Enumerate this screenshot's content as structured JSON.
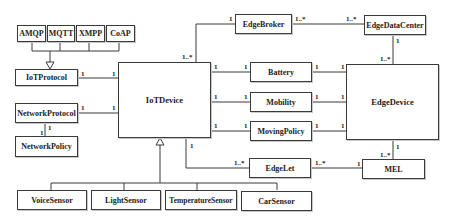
{
  "diagram": {
    "type": "UML class diagram",
    "classes": {
      "amqp": "AMQP",
      "mqtt": "MQTT",
      "xmpp": "XMPP",
      "coap": "CoAP",
      "iot_protocol": "IoTProtocol",
      "network_protocol": "NetworkProtocol",
      "network_policy": "NetworkPolicy",
      "iot_device": "IoTDevice",
      "edge_broker": "EdgeBroker",
      "edge_data_center": "EdgeDataCenter",
      "battery": "Battery",
      "mobility": "Mobility",
      "moving_policy": "MovingPolicy",
      "edge_device": "EdgeDevice",
      "edge_let": "EdgeLet",
      "mel": "MEL",
      "voice_sensor": "VoiceSensor",
      "light_sensor": "LightSensor",
      "temperature_sensor": "TemperatureSensor",
      "car_sensor": "CarSensor"
    },
    "multiplicities": {
      "iotprotocol_side": "1",
      "iotprotocol_device_side": "1",
      "netprotocol_side": "1",
      "netprotocol_device_side": "1",
      "netprotocol_policy_top": "1",
      "netpolicy_top": "1",
      "device_broker": "1..*",
      "broker_device": "1",
      "broker_dc": "1..*",
      "dc_broker": "1..*",
      "dc_edgedevice": "1",
      "edgedevice_dc": "1..*",
      "device_battery": "1",
      "battery_device": "1",
      "battery_edgedevice": "1",
      "edgedevice_battery": "1",
      "device_mobility": "1",
      "mobility_device": "1",
      "mobility_edgedevice": "1",
      "edgedevice_mobility": "1",
      "device_movingpolicy": "1",
      "movingpolicy_device": "1",
      "movingpolicy_edgedevice": "1",
      "edgedevice_movingpolicy": "1",
      "device_edgelet": "1",
      "edgelet_device": "1..*",
      "edgelet_mel": "1..*",
      "mel_edgelet": "1",
      "edgedevice_mel": "1",
      "mel_edgedevice": "1..*"
    }
  }
}
